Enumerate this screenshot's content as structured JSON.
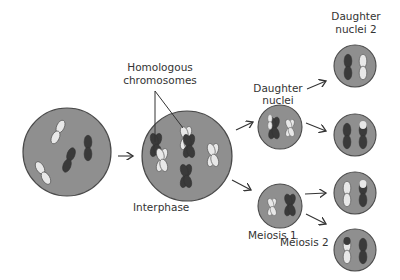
{
  "labels": {
    "homologous": [
      "Homologous",
      "chromosomes"
    ],
    "daughter_nuclei": [
      "Daughter",
      "nuclei"
    ],
    "daughter_nuclei_2": [
      "Daughter",
      "nuclei 2"
    ],
    "interphase": "Interphase",
    "meiosis1": "Meiosis 1",
    "meiosis2": "Meiosis 2"
  },
  "colors": {
    "cell_fill": "#8f8f8f",
    "cell_stroke": "#4a4a4a",
    "chromosome_dark": "#3a3a3a",
    "chromosome_light": "#e8e8e8",
    "text": "#333333"
  }
}
